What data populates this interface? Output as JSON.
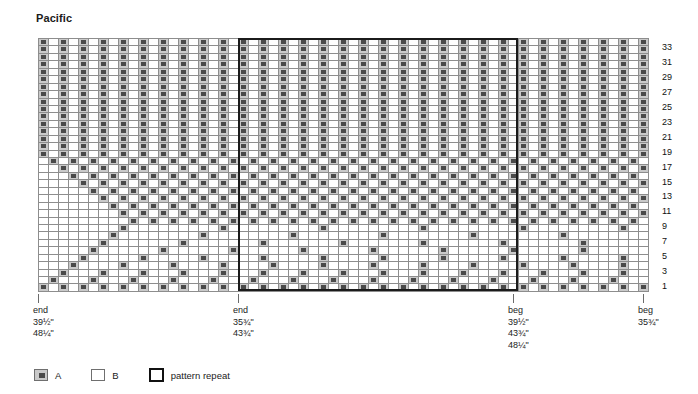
{
  "chart_title": "Pacific",
  "legend": [
    {
      "key": "A",
      "label": "A",
      "swatch": "filled-x"
    },
    {
      "key": "B",
      "label": "B",
      "swatch": "empty"
    },
    {
      "key": "repeat",
      "label": "pattern repeat",
      "swatch": "thick-box"
    }
  ],
  "footer_markers": [
    {
      "id": "end-left",
      "label": "end",
      "sizes": [
        "39½\"",
        "48¼\""
      ],
      "col": 0
    },
    {
      "id": "end-mid",
      "label": "end",
      "sizes": [
        "35¾\"",
        "43¾\""
      ],
      "col": 20
    },
    {
      "id": "beg-right",
      "label": "beg",
      "sizes": [
        "39½\"",
        "43¾\"",
        "48¼\""
      ],
      "col": 47.5
    },
    {
      "id": "beg-far",
      "label": "beg",
      "sizes": [
        "35¾\""
      ],
      "col": 60.5
    }
  ],
  "row_labels": [
    "1",
    "3",
    "5",
    "7",
    "9",
    "11",
    "13",
    "15",
    "17",
    "19",
    "21",
    "23",
    "25",
    "27",
    "29",
    "31",
    "33"
  ],
  "colors": {
    "colorA_fill": "#c9c9c9",
    "colorA_mark": "#4a4a4a",
    "colorB_fill": "#ffffff",
    "grid_line": "#8d8d8d",
    "repeat_border": "#1b1b1b",
    "text": "#1b1b1b"
  },
  "chart_data": {
    "type": "heatmap",
    "title": "Pacific",
    "xlabel": "",
    "ylabel": "",
    "grid": true,
    "legend_position": "bottom-left",
    "columns": 61,
    "rows": 34,
    "row_numbering": "odd rows labeled 1-33, bottom to top, right side",
    "cell_values": {
      "A": "x-marked cell (color A)",
      "B": "blank cell (color B)"
    },
    "repeat_boxes": [
      {
        "col_start": 20,
        "col_end": 47,
        "row_start": 0,
        "row_end": 33
      }
    ],
    "rows_bottom_to_top": [
      "ABABABABABABABABABABABABABABABABABABABABABABABABABABABABABABA",
      "BABBBABBBABBBABBBABBBABBBABBBABBBABBBABBBABBBABBBABBBABBBABBBA",
      "BBABBBABBBABBBABBBABBBABBBABBBABBBABBBABBBABBBABBBABBBABBBABBB",
      "BBBABBBBABBBBABBBBABBBBABBBBABBBBABBBBABBBBABBBBABBBBABBBBABBB",
      "BBBBABBBBBABBBBBABBBBBABBBBBABBBBBABBBBBABBBBBABBBBBABBBBBABBB",
      "BBBBBABBBBBBABBBBBBABBBBBBABBBBBBABBBBBBABBBBBBABBBBBBABBBBBBA",
      "BBBBBBABBBBBBBABBBBBBBABBBBBBBABBBBBBBABBBBBBBABBBBBBBABBBBBBB",
      "BBBBBBBABBBBBBBBABBBBBBBBABBBBBBBBABBBBBBBBABBBBBBBBABBBBBBBBA",
      "BBBBBBBBABBBBBBBBBABBBBBBBBBABBBBBBBBBABBBBBBBBBABBBBBBBBBABBB",
      "BBBBBBBBBABABABABABABABABABABABABABABABABABABABABABABABABABABA",
      "BBBBBBBBABABABABABABABABABABABABABABABABABABABABABABABABABABAB",
      "BBBBBBBABABABABABABABABABABABABABABABABABABABABABABABABABABABA",
      "BBBBBBABABABABABABABABABABABABABABABABABABABABABABABABABABABAB",
      "BBBBBABABABABABABABABABABABABABABABABABABABABABABABABABABABABA",
      "BBBBABABABABABABABABABABABABABABABABABABABABABABABABABABABABAB",
      "BBBABABABABABABABABABABABABABABABABABABABABABABABABABABABABABA",
      "BBABABABABABABABABABABABABABABABABABABABABABABABABABABABABABAB",
      "BABABABABABABABABABABABABABABABABABABABABABABABABABABABABABABA",
      "ABABABABABABABABABABABABABABABABABABABABABABABABABABABABABABAB",
      "ABABABABABABABABABABABABABABABABABABABABABABABABABABABABABABAB",
      "ABABABABABABABABABABABABABABABABABABABABABABABABABABABABABABAB",
      "ABABABABABABABABABABABABABABABABABABABABABABABABABABABABABABAB",
      "ABABABABABABABABABABABABABABABABABABABABABABABABABABABABABABAB",
      "ABABABABABABABABABABABABABABABABABABABABABABABABABABABABABABAB",
      "ABABABABABABABABABABABABABABABABABABABABABABABABABABABABABABAB",
      "ABABABABABABABABABABABABABABABABABABABABABABABABABABABABABABAB",
      "ABABABABABABABABABABABABABABABABABABABABABABABABABABABABABABAB",
      "ABABABABABABABABABABABABABABABABABABABABABABABABABABABABABABAB",
      "ABABABABABABABABABABABABABABABABABABABABABABABABABABABABABABAB",
      "ABABABABABABABABABABABABABABABABABABABABABABABABABABABABABABAB",
      "ABABABABABABABABABABABABABABABABABABABABABABABABABABABABABABAB",
      "ABABABABABABABABABABABABABABABABABABABABABABABABABABABABABABAB",
      "ABABABABABABABABABABABABABABABABABABABABABABABABABABABABABABAB",
      "ABABABABABABABABABABABABABABABABABABABABABABABABABABABABABABAB"
    ]
  }
}
